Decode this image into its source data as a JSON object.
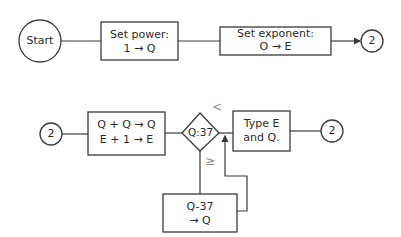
{
  "flowchart": {
    "row1": {
      "start": {
        "label": "Start"
      },
      "set_power": {
        "line1": "Set power:",
        "line2": "1 → Q"
      },
      "set_exponent": {
        "line1": "Set exponent:",
        "line2": "O → E"
      },
      "connector_out": {
        "label": "2"
      }
    },
    "row2": {
      "connector_in": {
        "label": "2"
      },
      "double": {
        "line1": "Q + Q → Q",
        "line2": "E + 1 → E"
      },
      "decision": {
        "label": "Q:37",
        "less_label": "<",
        "geq_label": "≥"
      },
      "type_output": {
        "line1": "Type E",
        "line2": "and Q."
      },
      "connector_out": {
        "label": "2"
      },
      "subtract": {
        "line1": "Q-37",
        "line2": "→ Q"
      }
    }
  },
  "colors": {
    "stroke": "#3a3a3a",
    "background": "#ffffff"
  }
}
